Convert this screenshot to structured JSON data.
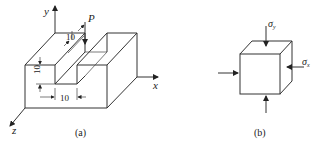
{
  "figure_a": {
    "caption": "(a)",
    "axes": {
      "x": "x",
      "y": "y",
      "z": "z"
    },
    "load_label": "P",
    "dimensions": {
      "slot_width": "10",
      "slot_depth": "10",
      "load_width": "10"
    }
  },
  "figure_b": {
    "caption": "(b)",
    "stress_y": "σ",
    "stress_y_sub": "y",
    "stress_x": "σ",
    "stress_x_sub": "x"
  }
}
